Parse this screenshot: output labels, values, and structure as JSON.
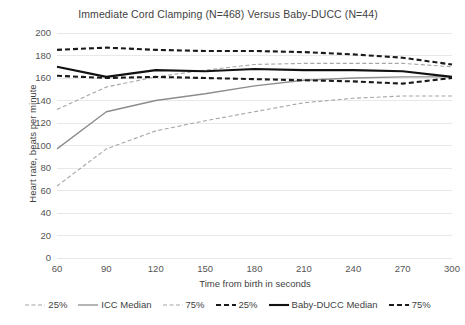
{
  "chart_data": {
    "type": "line",
    "title": "Immediate Cord Clamping (N=468) Versus Baby-DUCC (N=44)",
    "xlabel": "Time from birth in seconds",
    "ylabel": "Heart rate, beats per minute",
    "x": [
      60,
      90,
      120,
      150,
      180,
      210,
      240,
      270,
      300
    ],
    "xlim": [
      60,
      300
    ],
    "ylim": [
      0,
      200
    ],
    "xticks": [
      "60",
      "90",
      "120",
      "150",
      "180",
      "210",
      "240",
      "270",
      "300"
    ],
    "yticks": [
      "0",
      "20",
      "40",
      "60",
      "80",
      "100",
      "120",
      "140",
      "160",
      "180",
      "200"
    ],
    "grid": "horizontal",
    "legend_position": "bottom",
    "series": [
      {
        "name": "25%",
        "group": "ICC",
        "style": "dashed",
        "color": "#a6a6a6",
        "width": 1.1,
        "values": [
          64,
          97,
          113,
          122,
          130,
          138,
          142,
          144,
          144
        ]
      },
      {
        "name": "ICC Median",
        "group": "ICC",
        "style": "solid",
        "color": "#8c8c8c",
        "width": 1.3,
        "values": [
          97,
          130,
          140,
          146,
          153,
          158,
          160,
          161,
          161
        ]
      },
      {
        "name": "75%",
        "group": "ICC",
        "style": "dashed",
        "color": "#a6a6a6",
        "width": 1.1,
        "values": [
          132,
          152,
          161,
          167,
          172,
          173,
          173,
          173,
          170
        ]
      },
      {
        "name": "25%",
        "group": "Baby-DUCC",
        "style": "dashed-heavy",
        "color": "#1a1a1a",
        "width": 2.1,
        "values": [
          162,
          160,
          161,
          160,
          159,
          158,
          157,
          155,
          160
        ]
      },
      {
        "name": "Baby-DUCC Median",
        "group": "Baby-DUCC",
        "style": "solid",
        "color": "#111111",
        "width": 2.1,
        "values": [
          170,
          161,
          167,
          166,
          168,
          167,
          167,
          166,
          161
        ]
      },
      {
        "name": "75%",
        "group": "Baby-DUCC",
        "style": "dashed-heavy",
        "color": "#1a1a1a",
        "width": 2.1,
        "values": [
          185,
          187,
          185,
          184,
          184,
          183,
          181,
          178,
          172
        ]
      }
    ]
  },
  "legend": {
    "items": [
      {
        "label": "25%"
      },
      {
        "label": "ICC Median"
      },
      {
        "label": "75%"
      },
      {
        "label": "25%"
      },
      {
        "label": "Baby-DUCC Median"
      },
      {
        "label": "75%"
      }
    ]
  },
  "colors": {
    "grid": "#e8e8e8",
    "icc_light": "#a6a6a6",
    "icc_median": "#8c8c8c",
    "ducc": "#111111",
    "text": "#3f3f3f",
    "background": "#ffffff"
  }
}
